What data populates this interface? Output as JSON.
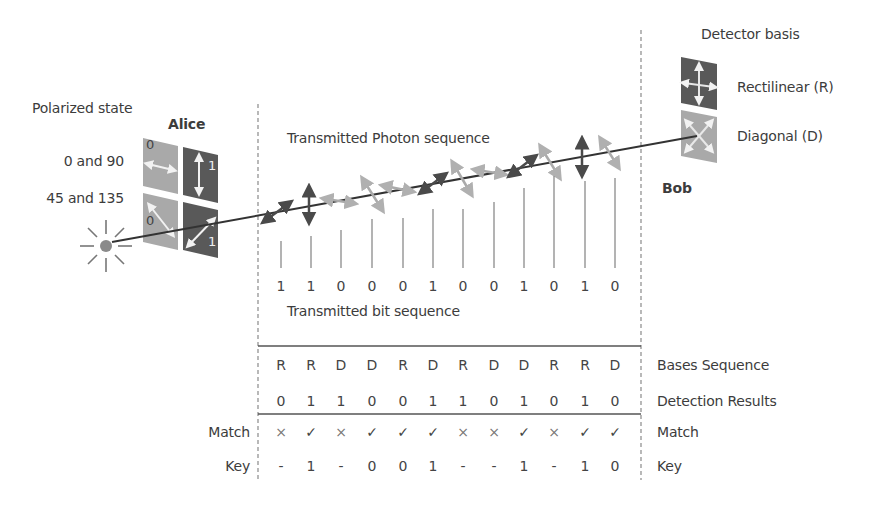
{
  "labels": {
    "polarized_state": "Polarized state",
    "alice": "Alice",
    "bob": "Bob",
    "state_0_90": "0 and 90",
    "state_45_135": "45 and 135",
    "detector_basis": "Detector basis",
    "rectilinear": "Rectilinear (R)",
    "diagonal": "Diagonal (D)",
    "transmitted_photon_sequence": "Transmitted Photon sequence",
    "transmitted_bit_sequence": "Transmitted bit sequence",
    "bases_sequence": "Bases Sequence",
    "detection_results": "Detection Results",
    "match_right": "Match",
    "key_right": "Key",
    "match_left": "Match",
    "key_left": "Key"
  },
  "alice_polarizer": {
    "top_left_bit": "0",
    "top_right_bit": "1",
    "bottom_left_bit": "0",
    "bottom_right_bit": "1"
  },
  "icons": {
    "light_source": "sun-burst-icon",
    "rectilinear_filter": "cross-arrows-icon",
    "diagonal_filter": "x-arrows-icon",
    "match_yes": "✓",
    "match_no": "×"
  },
  "colors": {
    "dark_filter": "#5a5a5a",
    "light_filter": "#a8a8a8",
    "beam": "#333333",
    "dashed": "#888888"
  },
  "photon_polarizations": [
    "diag45",
    "vertical",
    "diag135-light",
    "horizontal-light",
    "diag135-light",
    "horizontal-light",
    "horizontal-light",
    "diag45",
    "diag135-light",
    "diag135-light",
    "vertical",
    "diag135-light"
  ],
  "transmitted_bits": [
    "1",
    "1",
    "0",
    "0",
    "0",
    "1",
    "0",
    "0",
    "1",
    "0",
    "1",
    "0"
  ],
  "bases_sequence": [
    "R",
    "R",
    "D",
    "D",
    "R",
    "D",
    "R",
    "D",
    "D",
    "R",
    "R",
    "D"
  ],
  "detection_results": [
    "0",
    "1",
    "1",
    "0",
    "0",
    "1",
    "1",
    "0",
    "1",
    "0",
    "1",
    "0"
  ],
  "match": [
    "×",
    "✓",
    "×",
    "✓",
    "✓",
    "✓",
    "×",
    "×",
    "✓",
    "×",
    "✓",
    "✓"
  ],
  "key": [
    "-",
    "1",
    "-",
    "0",
    "0",
    "1",
    "-",
    "-",
    "1",
    "-",
    "1",
    "0"
  ]
}
